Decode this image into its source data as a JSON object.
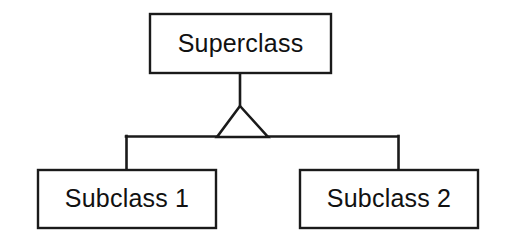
{
  "diagram": {
    "kind": "uml-class-diagram",
    "relationship": "generalization",
    "background_color": "#ffffff",
    "stroke_color": "#1a1a1a",
    "fill_color": "#ffffff",
    "text_color": "#111111",
    "nodes": {
      "superclass": {
        "label": "Superclass",
        "role": "parent",
        "x": 150,
        "y": 14,
        "width": 181,
        "height": 59,
        "center_x": 240.5,
        "center_y": 44
      },
      "subclass_1": {
        "label": "Subclass 1",
        "role": "child",
        "x": 38,
        "y": 170,
        "width": 178,
        "height": 58,
        "center_x": 127,
        "center_y": 199
      },
      "subclass_2": {
        "label": "Subclass 2",
        "role": "child",
        "x": 300,
        "y": 170,
        "width": 178,
        "height": 58,
        "center_x": 389,
        "center_y": 199
      }
    },
    "edges": {
      "parent_stem": {
        "name": "superclass-to-triangle-stem",
        "x": 240,
        "y_start": 73,
        "y_end": 108
      },
      "generalization_arrow": {
        "name": "hollow-triangle-arrowhead",
        "filled": false,
        "apex_x": 240,
        "apex_y": 106,
        "base_left_x": 217,
        "base_right_x": 268,
        "base_y": 137
      },
      "horizontal_bus": {
        "name": "subclass-horizontal-connector",
        "y": 136,
        "x_start": 126,
        "x_end": 398
      },
      "left_drop": {
        "name": "connector-to-subclass-1",
        "x": 126,
        "y_start": 136,
        "y_end": 171
      },
      "right_drop": {
        "name": "connector-to-subclass-2",
        "x": 398,
        "y_start": 136,
        "y_end": 171
      }
    }
  }
}
